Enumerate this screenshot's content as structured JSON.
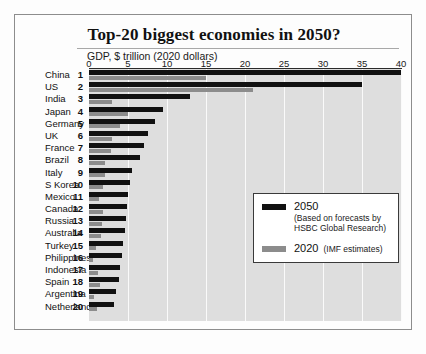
{
  "chart_data": {
    "type": "bar",
    "orientation": "horizontal",
    "title": "Top-20 biggest economies in 2050?",
    "xlabel": "GDP, $ trillion (2020 dollars)",
    "ylabel": "",
    "xlim": [
      0,
      40
    ],
    "xticks": [
      0,
      5,
      10,
      15,
      20,
      25,
      30,
      35,
      40
    ],
    "grid": true,
    "legend_position": "inside-bottom-right",
    "categories": [
      "China",
      "US",
      "India",
      "Japan",
      "Germany",
      "UK",
      "France",
      "Brazil",
      "Italy",
      "S Korea",
      "Mexico",
      "Canada",
      "Russia",
      "Australia",
      "Turkey",
      "Philippines",
      "Indonesia",
      "Spain",
      "Argentina",
      "Netherlands"
    ],
    "ranks": [
      1,
      2,
      3,
      4,
      5,
      6,
      7,
      8,
      9,
      10,
      11,
      12,
      13,
      14,
      15,
      16,
      17,
      18,
      19,
      20
    ],
    "series": [
      {
        "name": "2050",
        "color": "#111111",
        "values": [
          40.0,
          35.0,
          13.0,
          9.5,
          8.5,
          7.5,
          7.0,
          6.5,
          5.5,
          5.3,
          5.0,
          4.9,
          4.8,
          4.6,
          4.4,
          4.2,
          4.0,
          3.8,
          3.4,
          3.2
        ]
      },
      {
        "name": "2020",
        "color": "#8c8c8c",
        "values": [
          15.0,
          21.0,
          3.0,
          5.0,
          4.0,
          3.0,
          2.8,
          2.0,
          2.1,
          1.8,
          1.3,
          1.8,
          1.7,
          1.5,
          0.9,
          0.5,
          1.2,
          1.4,
          0.6,
          1.0
        ]
      }
    ]
  },
  "axis": {
    "caption": "GDP, $ trillion (2020 dollars)",
    "tick_labels": [
      "0",
      "5",
      "10",
      "15",
      "20",
      "25",
      "30",
      "35",
      "40"
    ]
  },
  "legend": {
    "item_2050_label": "2050",
    "item_2050_note_line1": "(Based on forecasts by",
    "item_2050_note_line2": "HSBC Global Research)",
    "item_2020_label": "2020",
    "item_2020_note": "(IMF estimates)"
  }
}
